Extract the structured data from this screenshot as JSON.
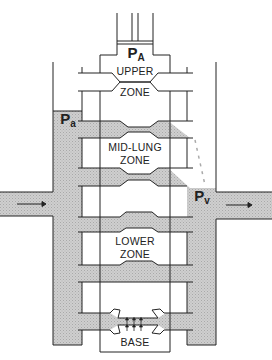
{
  "diagram": {
    "labels": {
      "alveolar_pressure": {
        "main": "P",
        "sub": "A"
      },
      "arterial_pressure": {
        "main": "P",
        "sub": "a"
      },
      "venous_pressure": {
        "main": "P",
        "sub": "v"
      },
      "upper_zone": [
        "UPPER",
        "ZONE"
      ],
      "mid_lung_zone": [
        "MID-LUNG",
        "ZONE"
      ],
      "lower_zone": [
        "LOWER",
        "ZONE"
      ],
      "base": "BASE"
    },
    "flow_arrows": [
      "arterial inflow (left, pointing right)",
      "venous outflow (right, pointing right)"
    ],
    "colors": {
      "line": "#222222",
      "blood_fill": "#c8c8c8",
      "background": "#ffffff"
    }
  }
}
